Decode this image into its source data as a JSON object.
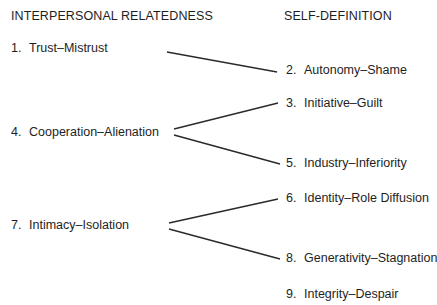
{
  "headers": {
    "left": "INTERPERSONAL RELATEDNESS",
    "right": "SELF-DEFINITION"
  },
  "left_items": [
    {
      "num": "1.",
      "label": "Trust–Mistrust"
    },
    {
      "num": "4.",
      "label": "Cooperation–Alienation"
    },
    {
      "num": "7.",
      "label": "Intimacy–Isolation"
    }
  ],
  "right_items": [
    {
      "num": "2.",
      "label": "Autonomy–Shame"
    },
    {
      "num": "3.",
      "label": "Initiative–Guilt"
    },
    {
      "num": "5.",
      "label": "Industry–Inferiority"
    },
    {
      "num": "6.",
      "label": "Identity–Role Diffusion"
    },
    {
      "num": "8.",
      "label": "Generativity–Stagnation"
    },
    {
      "num": "9.",
      "label": "Integrity–Despair"
    }
  ],
  "connections": [
    {
      "from": "1",
      "to": "2"
    },
    {
      "from": "4",
      "to": "3"
    },
    {
      "from": "4",
      "to": "5"
    },
    {
      "from": "7",
      "to": "6"
    },
    {
      "from": "7",
      "to": "8"
    }
  ],
  "colors": {
    "text": "#1e1e1e",
    "line": "#2a2a2a",
    "background": "#ffffff"
  }
}
